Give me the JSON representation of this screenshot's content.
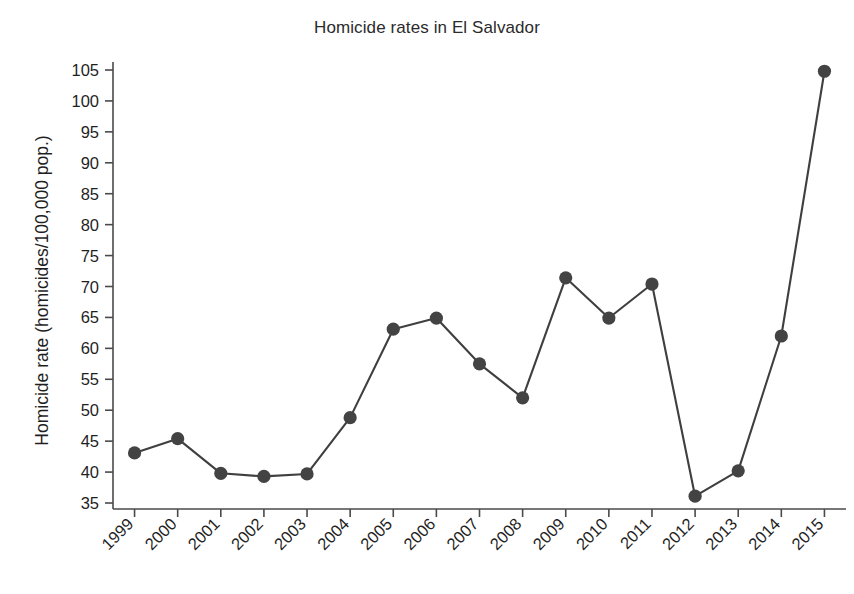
{
  "chart_data": {
    "type": "line",
    "title": "Homicide rates in El Salvador",
    "xlabel": "",
    "ylabel": "Homicide rate (homicides/100,000 pop.)",
    "categories": [
      "1999",
      "2000",
      "2001",
      "2002",
      "2003",
      "2004",
      "2005",
      "2006",
      "2007",
      "2008",
      "2009",
      "2010",
      "2011",
      "2012",
      "2013",
      "2014",
      "2015"
    ],
    "values": [
      43.1,
      45.4,
      39.8,
      39.3,
      39.7,
      48.8,
      63.1,
      64.9,
      57.5,
      52.0,
      71.4,
      64.9,
      70.4,
      36.1,
      40.2,
      62.0,
      104.8
    ],
    "series": [
      {
        "name": "Homicide rate",
        "values": [
          43.1,
          45.4,
          39.8,
          39.3,
          39.7,
          48.8,
          63.1,
          64.9,
          57.5,
          52.0,
          71.4,
          64.9,
          70.4,
          36.1,
          40.2,
          62.0,
          104.8
        ]
      }
    ],
    "ylim": [
      33.5,
      107.5
    ],
    "y_ticks": [
      35,
      40,
      45,
      50,
      55,
      60,
      65,
      70,
      75,
      80,
      85,
      90,
      95,
      100,
      105
    ],
    "y_tick_labels": [
      "35",
      "40",
      "45",
      "50",
      "55",
      "60",
      "65",
      "70",
      "75",
      "80",
      "85",
      "90",
      "95",
      "100",
      "105"
    ],
    "x_tick_labels": [
      "1999",
      "2000",
      "2001",
      "2002",
      "2003",
      "2004",
      "2005",
      "2006",
      "2007",
      "2008",
      "2009",
      "2010",
      "2011",
      "2012",
      "2013",
      "2014",
      "2015"
    ],
    "grid": false,
    "legend": "none",
    "marker": "circle",
    "line_color": "#3f3f3f",
    "marker_color": "#434343",
    "axis_color": "#4a4a4a",
    "background_color": "#ffffff",
    "x_tick_label_rotation": "45"
  }
}
